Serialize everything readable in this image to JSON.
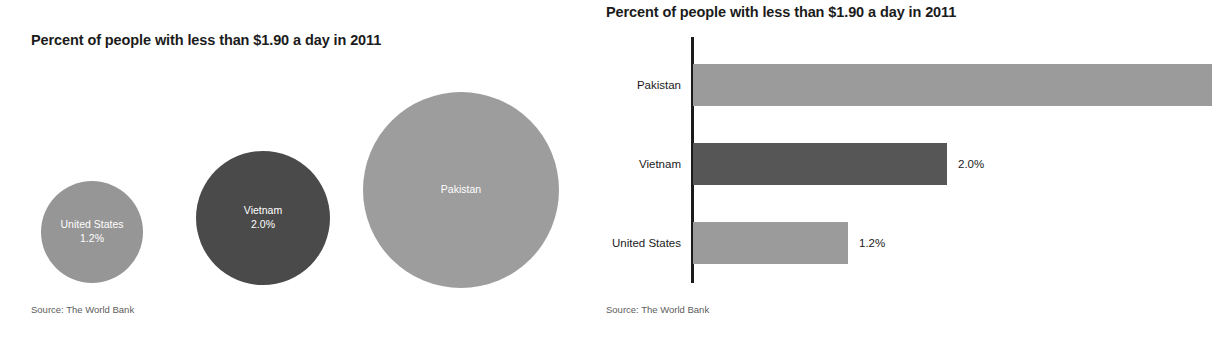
{
  "chart_data": [
    {
      "type": "bubble",
      "title": "Percent of people with less than $1.90 a day in 2011",
      "source": "Source: The World Bank",
      "xlabel": "",
      "ylabel": "",
      "grid": false,
      "legend": "none",
      "value_unit": "%",
      "categories": [
        "United States",
        "Vietnam",
        "Pakistan"
      ],
      "values": [
        1.2,
        2.0,
        null
      ],
      "points": [
        {
          "name": "United States",
          "label": "United States",
          "value_label": "1.2%",
          "value": 1.2,
          "color": "#969696",
          "text_color": "#ffffff",
          "diameter_px": 102,
          "cx_px": 92,
          "cy_px": 232
        },
        {
          "name": "Vietnam",
          "label": "Vietnam",
          "value_label": "2.0%",
          "value": 2.0,
          "color": "#4a4a4a",
          "text_color": "#ffffff",
          "diameter_px": 134,
          "cx_px": 263,
          "cy_px": 218
        },
        {
          "name": "Pakistan",
          "label": "Pakistan",
          "value_label": "",
          "value": null,
          "color": "#9d9d9d",
          "text_color": "#ffffff",
          "diameter_px": 196,
          "cx_px": 461,
          "cy_px": 190
        }
      ]
    },
    {
      "type": "bar",
      "orientation": "horizontal",
      "title": "Percent of people with less than $1.90 a day in 2011",
      "source": "Source: The World Bank",
      "xlabel": "",
      "ylabel": "",
      "grid": false,
      "legend": "none",
      "value_unit": "%",
      "categories": [
        "Pakistan",
        "Vietnam",
        "United States"
      ],
      "values": [
        8.3,
        2.0,
        1.2
      ],
      "bars": [
        {
          "name": "Pakistan",
          "label": "Pakistan",
          "value_label": "",
          "value": 8.3,
          "color": "#9b9b9b",
          "length_px": 519,
          "top_px": 64
        },
        {
          "name": "Vietnam",
          "label": "Vietnam",
          "value_label": "2.0%",
          "value": 2.0,
          "color": "#565656",
          "length_px": 254,
          "top_px": 143
        },
        {
          "name": "United States",
          "label": "United States",
          "value_label": "1.2%",
          "value": 1.2,
          "color": "#9b9b9b",
          "length_px": 155,
          "top_px": 222
        }
      ]
    }
  ]
}
